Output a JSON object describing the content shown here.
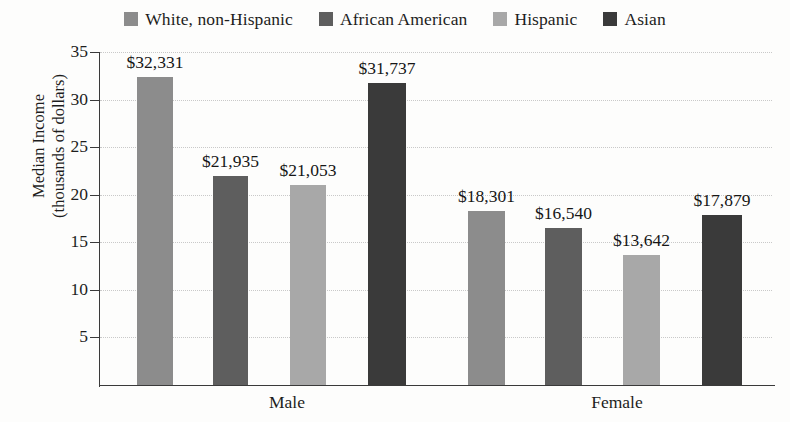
{
  "chart_data": {
    "type": "bar",
    "title": "",
    "xlabel": "",
    "ylabel": "Median Income (thousands of dollars)",
    "ylabel_lines": [
      "Median Income",
      "(thousands of dollars)"
    ],
    "categories": [
      "Male",
      "Female"
    ],
    "ylim": [
      0,
      35
    ],
    "yticks": [
      5,
      10,
      15,
      20,
      25,
      30,
      35
    ],
    "ytick_labels": [
      "5",
      "10",
      "15",
      "20",
      "25",
      "30",
      "35"
    ],
    "y_units": "thousands of dollars",
    "grid": true,
    "legend_position": "top-center",
    "series": [
      {
        "name": "White, non-Hispanic",
        "color": "#8c8c8c",
        "values": [
          32.331,
          18.301
        ],
        "data_labels": [
          "$32,331",
          "$18,301"
        ]
      },
      {
        "name": "African American",
        "color": "#5e5e5e",
        "values": [
          21.935,
          16.54
        ],
        "data_labels": [
          "$21,935",
          "$16,540"
        ]
      },
      {
        "name": "Hispanic",
        "color": "#a8a8a8",
        "values": [
          21.053,
          13.642
        ],
        "data_labels": [
          "$21,053",
          "$13,642"
        ]
      },
      {
        "name": "Asian",
        "color": "#3a3a3a",
        "values": [
          31.737,
          17.879
        ],
        "data_labels": [
          "$31,737",
          "$17,879"
        ]
      }
    ]
  },
  "legend": {
    "items": [
      {
        "label": "White, non-Hispanic",
        "color": "#8c8c8c"
      },
      {
        "label": "African American",
        "color": "#5e5e5e"
      },
      {
        "label": "Hispanic",
        "color": "#a8a8a8"
      },
      {
        "label": "Asian",
        "color": "#3a3a3a"
      }
    ]
  },
  "axes": {
    "y_title_line1": "Median Income",
    "y_title_line2": "(thousands of dollars)",
    "y_tick_labels": [
      "35",
      "30",
      "25",
      "20",
      "15",
      "10",
      "5"
    ],
    "x_group_labels": [
      "Male",
      "Female"
    ]
  },
  "bars": [
    {
      "label": "$32,331",
      "value": 32.331,
      "color": "#8c8c8c",
      "group": "Male",
      "series": "White, non-Hispanic"
    },
    {
      "label": "$21,935",
      "value": 21.935,
      "color": "#5e5e5e",
      "group": "Male",
      "series": "African American"
    },
    {
      "label": "$21,053",
      "value": 21.053,
      "color": "#a8a8a8",
      "group": "Male",
      "series": "Hispanic"
    },
    {
      "label": "$31,737",
      "value": 31.737,
      "color": "#3a3a3a",
      "group": "Male",
      "series": "Asian"
    },
    {
      "label": "$18,301",
      "value": 18.301,
      "color": "#8c8c8c",
      "group": "Female",
      "series": "White, non-Hispanic"
    },
    {
      "label": "$16,540",
      "value": 16.54,
      "color": "#5e5e5e",
      "group": "Female",
      "series": "African American"
    },
    {
      "label": "$13,642",
      "value": 13.642,
      "color": "#a8a8a8",
      "group": "Female",
      "series": "Hispanic"
    },
    {
      "label": "$17,879",
      "value": 17.879,
      "color": "#3a3a3a",
      "group": "Female",
      "series": "Asian"
    }
  ]
}
